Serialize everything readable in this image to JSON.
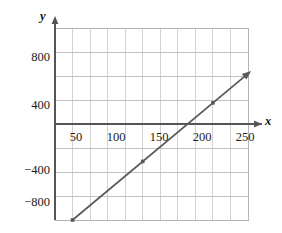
{
  "chart_data": {
    "type": "line",
    "title": "",
    "subtitle": "",
    "xlabel": "x",
    "ylabel": "y",
    "xlim": [
      -25,
      262
    ],
    "ylim": [
      -1000,
      1000
    ],
    "x_ticks": [
      50,
      100,
      150,
      200,
      250
    ],
    "x_tick_labels": [
      "50",
      "100",
      "150",
      "200",
      "250"
    ],
    "y_ticks": [
      800,
      400,
      -400,
      -800
    ],
    "y_tick_labels": [
      "800",
      "400",
      "−400",
      "−800"
    ],
    "x_gridline_step": 25,
    "y_gridline_step": 200,
    "grid": true,
    "legend": null,
    "axis_origin": [
      0,
      0
    ],
    "series": [
      {
        "name": "line",
        "type": "line",
        "x": [
          0,
          250
        ],
        "y": [
          -800,
          420
        ],
        "slope": 4.88,
        "intercept": -800,
        "x_intercept": 164,
        "arrow_end": true,
        "arrow_start": false,
        "color": "#595959",
        "markers": [
          {
            "x": 0,
            "y": -800
          },
          {
            "x": 100,
            "y": -312
          },
          {
            "x": 200,
            "y": 176
          }
        ]
      }
    ],
    "colors": {
      "line": "#595959",
      "axis": "#555555",
      "grid_major": "#aaaaaa",
      "grid_minor": "#d6d6d6",
      "text": "#1a1a1a",
      "background": "#ffffff"
    }
  },
  "axis_labels": {
    "x": "x",
    "y": "y"
  }
}
